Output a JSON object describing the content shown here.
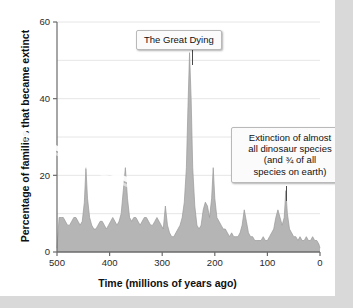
{
  "figure": {
    "background_color": "#ffffff",
    "margin_color": "#d9d9d9"
  },
  "annotations": {
    "great_dying": {
      "text": "The Great Dying",
      "at_x": 252,
      "at_y": 52
    },
    "dinosaur_extinction": {
      "line1": "Extinction of almost",
      "line2": "all dinosaur species",
      "line3": "(and ¾ of all",
      "line4": "species on earth)",
      "at_x": 65,
      "at_y": 16
    }
  },
  "chart_data": {
    "type": "area",
    "title": "",
    "subtitle": "",
    "xlabel": "Time  (millions of years ago)",
    "ylabel": "Percentage of families that became extinct",
    "xlim": [
      500,
      0
    ],
    "ylim": [
      0,
      60
    ],
    "x_ticks": [
      500,
      400,
      300,
      200,
      100,
      0
    ],
    "y_ticks": [
      0,
      20,
      40,
      60
    ],
    "gridlines": [
      0,
      10,
      20,
      30,
      40,
      50,
      60
    ],
    "grid": true,
    "legend": "none",
    "area_color": "#b5b5b5",
    "line_color": "#9a9a9a",
    "axis_color": "#6b6b6b",
    "x": [
      500,
      496,
      492,
      488,
      484,
      480,
      476,
      472,
      468,
      464,
      460,
      456,
      452,
      448,
      445,
      442,
      438,
      434,
      430,
      426,
      422,
      418,
      414,
      410,
      406,
      402,
      398,
      394,
      390,
      386,
      382,
      378,
      374,
      370,
      366,
      362,
      358,
      354,
      350,
      346,
      342,
      338,
      334,
      330,
      326,
      322,
      318,
      314,
      310,
      306,
      302,
      298,
      294,
      290,
      286,
      282,
      278,
      274,
      270,
      266,
      262,
      258,
      254,
      251,
      248,
      245,
      242,
      238,
      234,
      230,
      226,
      222,
      218,
      214,
      210,
      206,
      203,
      200,
      196,
      192,
      188,
      184,
      180,
      176,
      172,
      168,
      164,
      160,
      156,
      152,
      148,
      144,
      140,
      136,
      132,
      128,
      124,
      120,
      116,
      112,
      108,
      104,
      100,
      96,
      92,
      88,
      84,
      80,
      76,
      72,
      68,
      65,
      62,
      58,
      54,
      50,
      46,
      42,
      38,
      34,
      30,
      26,
      22,
      18,
      14,
      10,
      6,
      2,
      0
    ],
    "values": [
      1,
      9,
      9,
      9,
      8,
      7,
      7,
      8,
      9,
      9,
      8,
      7,
      8,
      13,
      22,
      14,
      9,
      7,
      6,
      6,
      7,
      8,
      8,
      7,
      6,
      7,
      8,
      9,
      8,
      7,
      8,
      10,
      16,
      22,
      14,
      9,
      8,
      9,
      9,
      8,
      7,
      8,
      9,
      9,
      8,
      7,
      7,
      8,
      9,
      8,
      7,
      6,
      12,
      7,
      5,
      4,
      4,
      5,
      6,
      7,
      9,
      13,
      22,
      38,
      52,
      40,
      22,
      12,
      7,
      6,
      7,
      11,
      13,
      12,
      9,
      14,
      22,
      14,
      9,
      8,
      7,
      6,
      6,
      5,
      4,
      5,
      4,
      4,
      4,
      5,
      7,
      11,
      8,
      5,
      4,
      4,
      3,
      3,
      3,
      3,
      4,
      3,
      3,
      4,
      5,
      6,
      9,
      11,
      9,
      7,
      9,
      16,
      10,
      6,
      5,
      4,
      4,
      3,
      4,
      3,
      3,
      4,
      3,
      3,
      4,
      3,
      3,
      2,
      1
    ],
    "peaks": [
      {
        "label": "End-Ordovician",
        "x": 445,
        "y": 22
      },
      {
        "label": "Late Devonian",
        "x": 370,
        "y": 22
      },
      {
        "label": "The Great Dying (End-Permian)",
        "x": 248,
        "y": 52
      },
      {
        "label": "End-Triassic",
        "x": 203,
        "y": 22
      },
      {
        "label": "End-Cretaceous (K-Pg)",
        "x": 65,
        "y": 16
      }
    ]
  },
  "plot_geometry": {
    "left_px": 57,
    "right_px": 320,
    "top_px": 22,
    "bottom_px": 252
  }
}
